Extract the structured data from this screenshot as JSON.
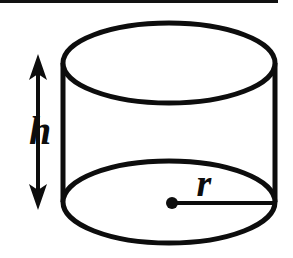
{
  "figure": {
    "kind": "geometry-diagram",
    "width": 293,
    "height": 258,
    "background_color": "#ffffff",
    "stroke_color": "#0d0d0d"
  },
  "rule": {
    "name": "top-horizontal-rule",
    "x": 0,
    "y": 0,
    "width": 278,
    "height": 3,
    "color": "#111111"
  },
  "cylinder": {
    "left_x": 63,
    "right_x": 275,
    "center_x": 169,
    "radius_x": 106,
    "top_ellipse": {
      "center_y": 63,
      "radius_y": 40,
      "top_y": 23,
      "bottom_y": 103
    },
    "bottom_ellipse": {
      "center_y": 202,
      "radius_y": 41,
      "top_y": 161,
      "bottom_y": 243
    },
    "stroke_width": 5,
    "fill": "#ffffff"
  },
  "height_dimension": {
    "label": "h",
    "label_x": 40,
    "label_y": 144,
    "label_font_size": 40,
    "shaft_x": 38,
    "top_tip_y": 54,
    "bottom_tip_y": 210,
    "shaft_width": 4,
    "arrow_head_half_width": 8,
    "arrow_head_length": 20,
    "color": "#0d0d0d"
  },
  "radius_dimension": {
    "label": "r",
    "label_x": 204,
    "label_y": 196,
    "label_font_size": 38,
    "line_start_x": 172,
    "line_start_y": 203,
    "line_end_x": 274,
    "line_end_y": 203,
    "line_width": 4,
    "dot_x": 172,
    "dot_y": 203,
    "dot_radius": 6,
    "color": "#0d0d0d"
  }
}
